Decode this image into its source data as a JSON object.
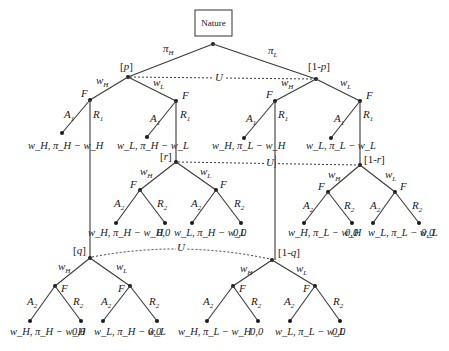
{
  "diagram": {
    "type": "extensive-form game tree",
    "root": "Nature",
    "nature_moves": {
      "left": "π_H",
      "right": "π_L"
    },
    "beliefs": {
      "p": "[p]",
      "one_minus_p": "[1-p]",
      "r": "[r]",
      "one_minus_r": "[1-r]",
      "q": "[q]",
      "one_minus_q": "[1-q]"
    },
    "info_set_label": "U",
    "actions": {
      "wH": "w_H",
      "wL": "w_L",
      "F": "F",
      "A1": "A_1",
      "R1": "R_1",
      "A2": "A_2",
      "R2": "R_2"
    },
    "payoffs_row1": [
      "w_H, π_H − w_H",
      "w_L, π_H − w_L",
      "w_H, π_L − w_H",
      "w_L, π_L − w_L"
    ],
    "payoffs_row2": [
      "w_H, π_H − w_H",
      "0,0",
      "w_L, π_H − w_L",
      "0,0",
      "w_H, π_L − w_H",
      "0,0",
      "w_L, π_L − w_L",
      "0,0"
    ],
    "payoffs_row3": [
      "w_H, π_H − w_H",
      "0,0",
      "w_L, π_H − w_L",
      "0,0",
      "w_H, π_L − w_H",
      "0,0",
      "w_L, π_L − w_L",
      "0,0"
    ]
  }
}
